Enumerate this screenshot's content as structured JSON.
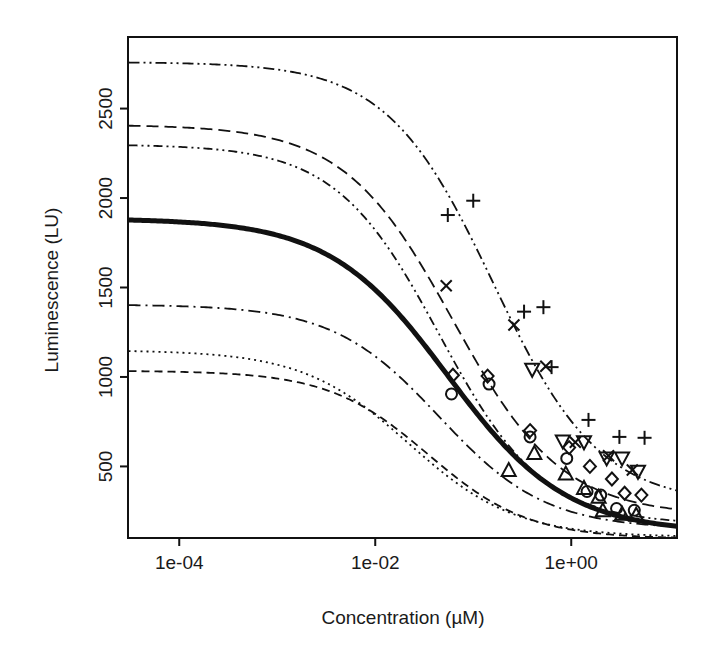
{
  "chart_data": {
    "type": "line",
    "title": "",
    "xlabel": "Concentration (µM)",
    "ylabel": "Luminescence (LU)",
    "xscale": "log10",
    "yscale": "linear",
    "xlim": [
      3e-05,
      12
    ],
    "ylim": [
      100,
      2900
    ],
    "grid": false,
    "legend": "none",
    "xticks": [
      {
        "value": 0.0001,
        "label": "1e-04"
      },
      {
        "value": 0.01,
        "label": "1e-02"
      },
      {
        "value": 1.0,
        "label": "1e+00"
      }
    ],
    "yticks": [
      {
        "value": 500,
        "label": "500"
      },
      {
        "value": 1000,
        "label": "1000"
      },
      {
        "value": 1500,
        "label": "1500"
      },
      {
        "value": 2000,
        "label": "2000"
      },
      {
        "value": 2500,
        "label": "2500"
      }
    ],
    "series": [
      {
        "name": "population-fit",
        "style": "solid",
        "width": 5,
        "dash": "",
        "top": 1885,
        "bottom": 130,
        "ec50": 0.055,
        "hill": 0.72
      },
      {
        "name": "subject-1-fit",
        "style": "dash-dot-dot",
        "width": 1.8,
        "dash": "11,4,2,4,2,4",
        "top": 2760,
        "bottom": 290,
        "ec50": 0.16,
        "hill": 0.8
      },
      {
        "name": "subject-2-fit",
        "style": "dashed",
        "width": 1.8,
        "dash": "12,6",
        "top": 2410,
        "bottom": 225,
        "ec50": 0.062,
        "hill": 0.78
      },
      {
        "name": "subject-3-fit",
        "style": "dash-dot-dot",
        "width": 1.8,
        "dash": "9,4,2,4,2,4",
        "top": 2300,
        "bottom": 175,
        "ec50": 0.045,
        "hill": 0.82
      },
      {
        "name": "subject-4-fit",
        "style": "dash-dot",
        "width": 1.8,
        "dash": "12,5,2,5",
        "top": 1405,
        "bottom": 150,
        "ec50": 0.045,
        "hill": 0.8
      },
      {
        "name": "subject-5-fit",
        "style": "dotted",
        "width": 1.8,
        "dash": "2,4",
        "top": 1150,
        "bottom": 105,
        "ec50": 0.022,
        "hill": 0.8
      },
      {
        "name": "subject-6-fit",
        "style": "dashed-fine",
        "width": 1.8,
        "dash": "8,5",
        "top": 1035,
        "bottom": 95,
        "ec50": 0.035,
        "hill": 0.85
      }
    ],
    "point_groups": [
      {
        "name": "group-plus",
        "marker": "plus",
        "points": [
          {
            "x": 0.055,
            "y": 1905
          },
          {
            "x": 0.1,
            "y": 1985
          },
          {
            "x": 0.33,
            "y": 1365
          },
          {
            "x": 0.52,
            "y": 1390
          },
          {
            "x": 0.63,
            "y": 1055
          },
          {
            "x": 1.5,
            "y": 760
          },
          {
            "x": 3.1,
            "y": 665
          },
          {
            "x": 5.6,
            "y": 660
          }
        ]
      },
      {
        "name": "group-x",
        "marker": "x",
        "points": [
          {
            "x": 0.053,
            "y": 1510
          },
          {
            "x": 0.26,
            "y": 1290
          },
          {
            "x": 0.55,
            "y": 1060
          },
          {
            "x": 1.1,
            "y": 635
          },
          {
            "x": 2.4,
            "y": 560
          },
          {
            "x": 4.2,
            "y": 480
          }
        ]
      },
      {
        "name": "group-triangle-down",
        "marker": "triangle-down",
        "points": [
          {
            "x": 0.4,
            "y": 1040
          },
          {
            "x": 0.82,
            "y": 640
          },
          {
            "x": 1.35,
            "y": 635
          },
          {
            "x": 2.3,
            "y": 545
          },
          {
            "x": 3.3,
            "y": 545
          },
          {
            "x": 4.8,
            "y": 470
          }
        ]
      },
      {
        "name": "group-diamond",
        "marker": "diamond",
        "points": [
          {
            "x": 0.062,
            "y": 1010
          },
          {
            "x": 0.14,
            "y": 1005
          },
          {
            "x": 0.38,
            "y": 700
          },
          {
            "x": 0.95,
            "y": 605
          },
          {
            "x": 1.55,
            "y": 500
          },
          {
            "x": 2.6,
            "y": 430
          },
          {
            "x": 3.5,
            "y": 350
          },
          {
            "x": 5.2,
            "y": 340
          }
        ]
      },
      {
        "name": "group-circle",
        "marker": "circle",
        "points": [
          {
            "x": 0.06,
            "y": 905
          },
          {
            "x": 0.145,
            "y": 960
          },
          {
            "x": 0.38,
            "y": 665
          },
          {
            "x": 0.9,
            "y": 545
          },
          {
            "x": 1.45,
            "y": 360
          },
          {
            "x": 2.0,
            "y": 340
          },
          {
            "x": 2.9,
            "y": 265
          },
          {
            "x": 4.4,
            "y": 255
          }
        ]
      },
      {
        "name": "group-triangle-up",
        "marker": "triangle-up",
        "points": [
          {
            "x": 0.23,
            "y": 480
          },
          {
            "x": 0.42,
            "y": 575
          },
          {
            "x": 0.88,
            "y": 460
          },
          {
            "x": 1.35,
            "y": 380
          },
          {
            "x": 1.9,
            "y": 330
          },
          {
            "x": 2.1,
            "y": 255
          },
          {
            "x": 3.3,
            "y": 235
          },
          {
            "x": 4.6,
            "y": 230
          }
        ]
      }
    ]
  },
  "geometry": {
    "plot_left": 128,
    "plot_right": 677,
    "plot_top": 37,
    "plot_bottom": 538,
    "tick_len": 8
  }
}
